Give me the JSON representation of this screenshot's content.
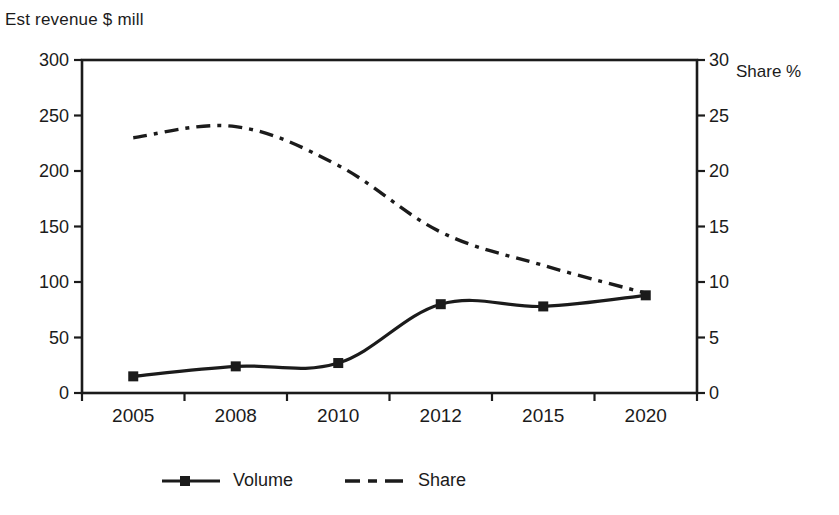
{
  "chart_data": {
    "type": "line",
    "title": "",
    "x_categories": [
      "2005",
      "2008",
      "2010",
      "2012",
      "2015",
      "2020"
    ],
    "left_axis": {
      "label": "Est revenue $ mill",
      "min": 0,
      "max": 300,
      "tick_step": 50,
      "tick_labels": [
        "0",
        "50",
        "100",
        "150",
        "200",
        "250",
        "300"
      ]
    },
    "right_axis": {
      "label": "Share %",
      "min": 0,
      "max": 30,
      "tick_step": 5,
      "tick_labels": [
        "0",
        "5",
        "10",
        "15",
        "20",
        "25",
        "30"
      ]
    },
    "series": [
      {
        "name": "Volume",
        "axis": "left",
        "line_style": "solid",
        "marker": "filled-square",
        "values": [
          15,
          24,
          27,
          80,
          78,
          88
        ]
      },
      {
        "name": "Share",
        "axis": "right",
        "line_style": "dash-dot",
        "marker": "none",
        "values": [
          23,
          24,
          20.5,
          14.5,
          11.5,
          9
        ]
      }
    ],
    "legend": {
      "position": "bottom",
      "entries": [
        "Volume",
        "Share"
      ]
    },
    "grid": "off",
    "colors": {
      "ink": "#1b1b1b",
      "background": "#ffffff"
    }
  }
}
